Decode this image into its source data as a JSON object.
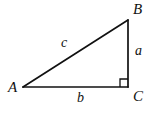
{
  "figure": {
    "kind": "right-triangle-diagram",
    "background_color": "#ffffff",
    "stroke_color": "#111111",
    "canvas": {
      "width": 160,
      "height": 114
    },
    "vertices": [
      {
        "id": "A",
        "label": "A",
        "x": 23,
        "y": 87,
        "angle_type": "acute"
      },
      {
        "id": "B",
        "label": "B",
        "x": 128,
        "y": 20,
        "angle_type": "acute"
      },
      {
        "id": "C",
        "label": "C",
        "x": 128,
        "y": 87,
        "angle_type": "right"
      }
    ],
    "sides": [
      {
        "id": "c",
        "label": "c",
        "from": "A",
        "to": "B",
        "role": "hypotenuse",
        "label_x": 65,
        "label_y": 43
      },
      {
        "id": "a",
        "label": "a",
        "from": "B",
        "to": "C",
        "role": "opposite-leg",
        "label_x": 139,
        "label_y": 51
      },
      {
        "id": "b",
        "label": "b",
        "from": "A",
        "to": "C",
        "role": "adjacent-leg",
        "label_x": 81,
        "label_y": 98
      }
    ],
    "right_angle_marker": {
      "name": "right-angle-square",
      "at_vertex": "C",
      "x": 120,
      "y": 79,
      "size": 8
    }
  }
}
